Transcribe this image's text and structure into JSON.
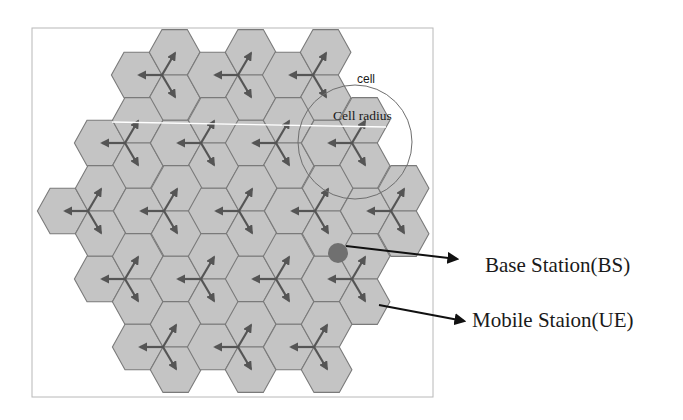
{
  "diagram": {
    "title": "",
    "labels": {
      "cell": "cell",
      "cell_radius": "Cell radius",
      "base_station": "Base Station(BS)",
      "mobile_station": "Mobile Staion(UE)"
    },
    "colors": {
      "hex_fill": "#c4c4c4",
      "hex_stroke": "#7a7a7a",
      "arrow": "#555555",
      "frame": "#b8b8b8",
      "circle": "#6e6e6e",
      "bs_dot": "#707070",
      "pointer": "#111111",
      "text": "#1a1a1a",
      "radius_line": "#ffffff"
    },
    "geometry": {
      "frame": {
        "x": 32,
        "y": 28,
        "w": 401,
        "h": 369
      },
      "hex_radius": 25.3,
      "hex_half_height": 22.7,
      "sites": [
        [
          162,
          75
        ],
        [
          238,
          75
        ],
        [
          313,
          75
        ],
        [
          125,
          143
        ],
        [
          201,
          143
        ],
        [
          276,
          143
        ],
        [
          352,
          143
        ],
        [
          88,
          211
        ],
        [
          164,
          211
        ],
        [
          239,
          211
        ],
        [
          315,
          211
        ],
        [
          391,
          211
        ],
        [
          125,
          279
        ],
        [
          201,
          279
        ],
        [
          276,
          279
        ],
        [
          352,
          279
        ],
        [
          163,
          347
        ],
        [
          238,
          347
        ],
        [
          314,
          347
        ]
      ],
      "cell_circle": {
        "cx": 355,
        "cy": 142,
        "r": 57
      },
      "radius_line": {
        "x1": 112,
        "y1": 122,
        "x2": 386,
        "y2": 127
      },
      "base_station": {
        "cx": 338,
        "cy": 253,
        "r": 10
      },
      "bs_pointer": {
        "x1": 346,
        "y1": 246,
        "x2": 457,
        "y2": 259
      },
      "ue_pointer": {
        "x1": 379,
        "y1": 305,
        "x2": 464,
        "y2": 321
      },
      "label_pos": {
        "cell": {
          "x": 357,
          "y": 83
        },
        "cell_radius": {
          "x": 333,
          "y": 120
        },
        "base_station": {
          "x": 485,
          "y": 272
        },
        "mobile_station": {
          "x": 472,
          "y": 327
        }
      }
    },
    "counts": {
      "sites": 19,
      "sectors_per_site": 3,
      "cells": 57
    }
  }
}
